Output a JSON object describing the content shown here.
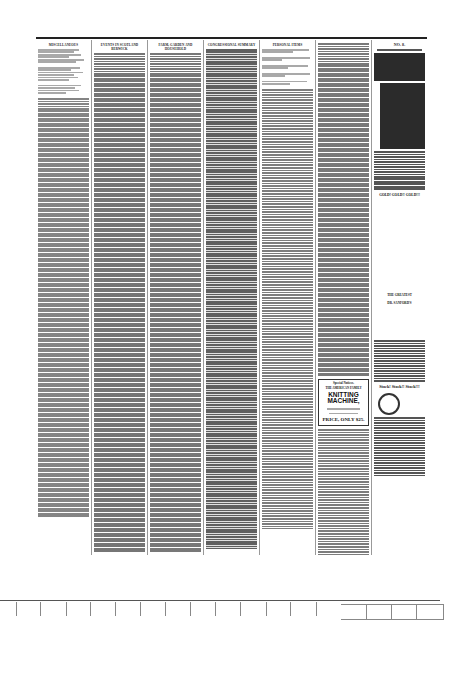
{
  "page": {
    "type": "scanned newspaper page",
    "columns": 7
  },
  "columns": [
    {
      "heading": "Miscellaneous",
      "note": "poem column followed by prose text"
    },
    {
      "heading": "Events in Scotland Berwick",
      "note": "dense article text"
    },
    {
      "heading": "Farm, Garden and Household",
      "note": "dense article text"
    },
    {
      "heading": "Congressional Summary",
      "note": "dense article text"
    },
    {
      "heading": "Personal Items",
      "note": "short news paragraphs"
    },
    {
      "heading": "",
      "note": "news text with Special Notices ad"
    },
    {
      "heading": "No. 8.",
      "note": "advertisement column"
    }
  ],
  "ads": {
    "knitting_machine": {
      "label": "Special Notices.",
      "line1": "THE AMERICAN FAMILY",
      "line2": "KNITTING MACHINE,",
      "price": "PRICE, ONLY $25."
    },
    "right_column": {
      "number": "No. 8.",
      "item1": "GOLD! GOLD!! GOLD!!!",
      "item2": "THE GREATEST",
      "item3": "DR. SANFORD'S",
      "footer": "Stock! Stock!! Stock!!!"
    }
  },
  "ruler": {
    "ticks": 18
  }
}
